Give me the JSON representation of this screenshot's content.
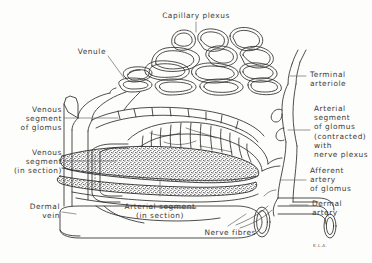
{
  "figure": {
    "title": "Capillary plexus",
    "background_color": "#fdfdfb",
    "ink_color": "#3a3a3a",
    "line_color": "#2e2e2e",
    "width": 372,
    "height": 263
  },
  "labels": {
    "capillary_plexus": "Capillary plexus",
    "venule": "Venule",
    "venous_segment_of_glomus": "Venous\nsegment\nof glomus",
    "venous_segment_in_section": "Venous\nsegment\n(in section)",
    "dermal_vein": "Dermal\nvein",
    "arterial_segment_in_section": "Arterial segment\n(in section)",
    "nerve_fibres": "Nerve fibres",
    "terminal_arteriole": "Terminal\narteriole",
    "arterial_segment_of_glomus": "Arterial\nsegment\nof glomus\n(contracted)\nwith\nnerve plexus",
    "afferent_artery_of_glomus": "Afferent\nartery\nof glomus",
    "dermal_artery": "Dermal\nartery",
    "signature": "K.L.A."
  },
  "structures": [
    {
      "name": "capillary-plexus",
      "description": "network of anastomosing capillary loops at top of figure"
    },
    {
      "name": "venule",
      "description": "broad draining tube descending left from plexus"
    },
    {
      "name": "venous-segment-of-glomus",
      "description": "upper coiled venous limb of glomus body"
    },
    {
      "name": "venous-segment-in-section",
      "description": "cut venous limb shown in longitudinal section"
    },
    {
      "name": "arterial-segment-of-glomus",
      "description": "thick banded contracted arterial coil with nerve plexus"
    },
    {
      "name": "arterial-segment-in-section",
      "description": "stippled thick-walled arterial segment in section"
    },
    {
      "name": "terminal-arteriole",
      "description": "small vessel ascending at right into plexus"
    },
    {
      "name": "afferent-artery-of-glomus",
      "description": "vessel at right feeding the glomus"
    },
    {
      "name": "dermal-artery",
      "description": "narrow tube at lower right with cut elliptical end"
    },
    {
      "name": "dermal-vein",
      "description": "large tube at lower left with cut elliptical end"
    },
    {
      "name": "nerve-fibres",
      "description": "fine fibres running to the glomus at lower right"
    }
  ]
}
